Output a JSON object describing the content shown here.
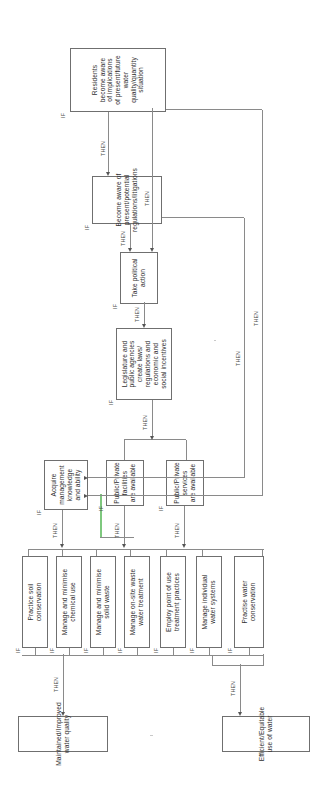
{
  "diagram": {
    "orientation": "rotated-90-ccw",
    "connector_labels": {
      "if": "IF",
      "then": "THEN"
    },
    "accent_green": "#7ec87e",
    "line_color": "#8a8a8a"
  },
  "outcomes": [
    {
      "id": "water-quality",
      "text": "Maintained/Improved\nwater quality"
    },
    {
      "id": "water-use",
      "text": "Efficient/Equitable\nuse of water"
    }
  ],
  "practices": [
    {
      "id": "soil-conservation",
      "text": "Practice soil\nconservation"
    },
    {
      "id": "chemical-use",
      "text": "Manage and minimise\nchemical use"
    },
    {
      "id": "solid-waste",
      "text": "Manage and minimise\nsolid waste"
    },
    {
      "id": "onsite-waste-water",
      "text": "Manage on-site waste\nwater treatment"
    },
    {
      "id": "point-of-use",
      "text": "Employ point of use\ntreatment practices"
    },
    {
      "id": "individual-water-systems",
      "text": "Manage individual\nwater systems"
    },
    {
      "id": "water-conservation",
      "text": "Practise water\nconservation"
    }
  ],
  "enablers": [
    {
      "id": "management-knowledge",
      "text": "Acquire\nmanagement\nknowledge\nand ability"
    },
    {
      "id": "pp-facilities",
      "text": "Public/Private\nfacilities\nare available"
    },
    {
      "id": "pp-services",
      "text": "Public/Private\nservices\nare available"
    }
  ],
  "drivers": [
    {
      "id": "legislature",
      "text": "Legislature and\npublic agencies\ncreate laws/\nregulations and\neconomic and\nsocial incentives"
    },
    {
      "id": "political-action",
      "text": "Take political\naction"
    },
    {
      "id": "become-aware",
      "text": "Become aware of\npresent/potential\nregulations/litigations"
    },
    {
      "id": "residents-aware",
      "text": "Residents\nbecome aware\nof implications\nof present/future\nwater\nquality/quantity\nsituation"
    }
  ],
  "labels": {
    "if_markers": [
      "IF",
      "IF",
      "IF",
      "IF",
      "IF",
      "IF",
      "IF",
      "IF",
      "IF",
      "IF",
      "IF",
      "IF",
      "IF"
    ],
    "then_markers": [
      "THEN",
      "THEN",
      "THEN",
      "THEN",
      "THEN",
      "THEN",
      "THEN",
      "THEN",
      "THEN",
      "THEN"
    ]
  }
}
